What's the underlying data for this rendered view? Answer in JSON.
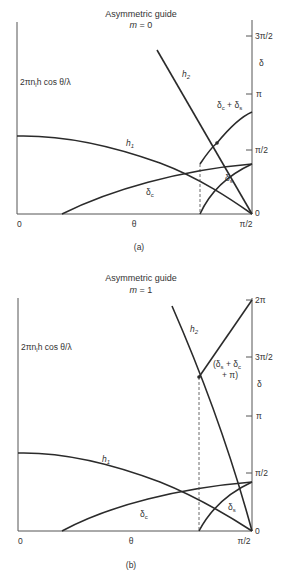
{
  "panels": [
    {
      "id": "a",
      "title": "Asymmetric guide",
      "mode_label": "m = 0",
      "mode_var": "m",
      "mode_value": "0",
      "left_axis_label": "2πn₁h cos θ/λ",
      "right_axis_symbol": "δ",
      "x_axis_label": "θ",
      "x_ticks": [
        "0",
        "π/2"
      ],
      "right_ticks": [
        "0",
        "π/2",
        "π",
        "3π/2"
      ],
      "curves": {
        "h1": "h₁",
        "h2": "h₂",
        "delta_c": "δc",
        "delta_s": "δs",
        "sum": "δc + δs"
      },
      "caption": "(a)"
    },
    {
      "id": "b",
      "title": "Asymmetric guide",
      "mode_label": "m = 1",
      "mode_var": "m",
      "mode_value": "1",
      "left_axis_label": "2πn₁h cos θ/λ",
      "right_axis_symbol": "δ",
      "x_axis_label": "θ",
      "x_ticks": [
        "0",
        "π/2"
      ],
      "right_ticks": [
        "0",
        "π/2",
        "π",
        "3π/2",
        "2π"
      ],
      "curves": {
        "h1": "h₁",
        "h2": "h₂",
        "delta_c": "δc",
        "delta_s": "δs",
        "sum_line1": "(δs + δc",
        "sum_line2": "+ π)"
      },
      "caption": "(b)"
    }
  ],
  "text": {
    "a_title": "Asymmetric guide",
    "a_m": "m",
    "a_m_eq": " = 0",
    "a_left": "2πn",
    "a_left_sub": "l",
    "a_left_rest": "h cos θ/λ",
    "a_delta": "δ",
    "a_t_3pi2": "3π/2",
    "a_t_pi": "π",
    "a_t_pi2": "π/2",
    "a_t_0": "0",
    "a_x0": "0",
    "a_theta": "θ",
    "a_xpi2": "π/2",
    "a_h1": "h",
    "a_h1_sub": "1",
    "a_h2": "h",
    "a_h2_sub": "2",
    "a_dc": "δ",
    "a_dc_sub": "c",
    "a_ds": "δ",
    "a_ds_sub": "s",
    "a_sum_1": "δ",
    "a_sum_1s": "c",
    "a_sum_plus": " + ",
    "a_sum_2": "δ",
    "a_sum_2s": "s",
    "a_caption": "(a)",
    "b_title": "Asymmetric guide",
    "b_m": "m",
    "b_m_eq": " = 1",
    "b_left": "2πn",
    "b_left_sub": "l",
    "b_left_rest": "h cos θ/λ",
    "b_delta": "δ",
    "b_t_2pi": "2π",
    "b_t_3pi2": "3π/2",
    "b_t_pi": "π",
    "b_t_pi2": "π/2",
    "b_t_0": "0",
    "b_x0": "0",
    "b_theta": "θ",
    "b_xpi2": "π/2",
    "b_h1": "h",
    "b_h1_sub": "1",
    "b_h2": "h",
    "b_h2_sub": "2",
    "b_dc": "δ",
    "b_dc_sub": "c",
    "b_ds": "δ",
    "b_ds_sub": "s",
    "b_sum_a": "(δ",
    "b_sum_as": "s",
    "b_sum_b": " + δ",
    "b_sum_bs": "c",
    "b_sum_c": "+ π)",
    "b_caption": "(b)"
  }
}
